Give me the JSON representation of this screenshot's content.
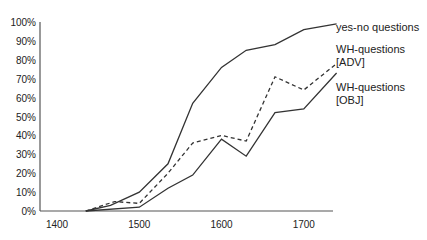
{
  "chart_data": {
    "type": "line",
    "title": "",
    "xlabel": "",
    "ylabel": "",
    "xlim": [
      1380,
      1750
    ],
    "ylim": [
      0,
      100
    ],
    "grid": false,
    "legend_position": "right, inline at line ends",
    "x_ticks": [
      "1400",
      "1500",
      "1600",
      "1700"
    ],
    "y_ticks": [
      "0%",
      "10%",
      "20%",
      "30%",
      "40%",
      "50%",
      "60%",
      "70%",
      "80%",
      "90%",
      "100%"
    ],
    "series": [
      {
        "name": "yes-no questions",
        "style": "solid",
        "label_lines": [
          "yes-no questions"
        ],
        "x": [
          1435,
          1465,
          1500,
          1535,
          1565,
          1600,
          1630,
          1665,
          1700,
          1740
        ],
        "values": [
          0,
          3,
          10,
          25,
          57,
          76,
          85,
          88,
          96,
          99
        ]
      },
      {
        "name": "WH-questions [ADV]",
        "style": "dashed",
        "label_lines": [
          "WH-questions",
          "[ADV]"
        ],
        "x": [
          1435,
          1470,
          1500,
          1535,
          1565,
          1600,
          1630,
          1665,
          1700,
          1740
        ],
        "values": [
          0,
          5,
          4,
          20,
          36,
          40,
          37,
          71,
          64,
          78
        ]
      },
      {
        "name": "WH-questions [OBJ]",
        "style": "solid",
        "label_lines": [
          "WH-questions",
          "[OBJ]"
        ],
        "x": [
          1435,
          1500,
          1535,
          1565,
          1600,
          1630,
          1665,
          1700,
          1740
        ],
        "values": [
          0,
          2,
          12,
          19,
          38,
          29,
          52,
          54,
          73
        ]
      }
    ]
  },
  "colors": {
    "line": "#333333",
    "axis": "#555555",
    "text": "#222222",
    "background": "#ffffff"
  }
}
